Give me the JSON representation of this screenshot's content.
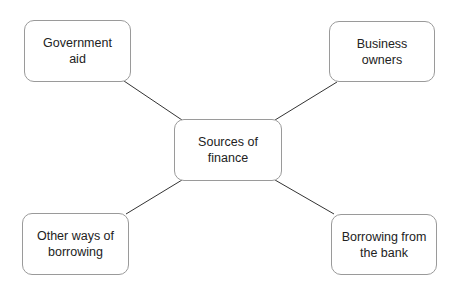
{
  "diagram": {
    "type": "mind-map",
    "center": {
      "label": "Sources of finance",
      "line1": "Sources of",
      "line2": "finance"
    },
    "branches": [
      {
        "id": "government-aid",
        "line1": "Government",
        "line2": "aid"
      },
      {
        "id": "business-owners",
        "line1": "Business",
        "line2": "owners"
      },
      {
        "id": "other-ways-of-borrowing",
        "line1": "Other ways of",
        "line2": "borrowing"
      },
      {
        "id": "borrowing-from-the-bank",
        "line1": "Borrowing from",
        "line2": "the bank"
      }
    ],
    "edges": [
      {
        "from": "Sources of finance",
        "to": "Government aid"
      },
      {
        "from": "Sources of finance",
        "to": "Business owners"
      },
      {
        "from": "Sources of finance",
        "to": "Other ways of borrowing"
      },
      {
        "from": "Sources of finance",
        "to": "Borrowing from the bank"
      }
    ]
  }
}
